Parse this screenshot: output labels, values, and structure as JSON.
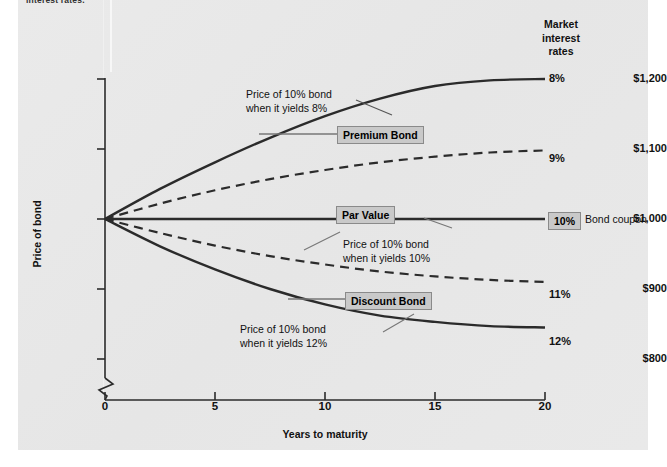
{
  "figure": {
    "top_caption": "interest rates.",
    "background_color": "#e8e8e8",
    "line_color": "#2b2b2b",
    "box_fill": "#c9c9c9"
  },
  "axes": {
    "ylabel": "Price of bond",
    "xlabel": "Years to maturity",
    "yticks": [
      "$1,200",
      "$1,100",
      "$1,000",
      "$900",
      "$800"
    ],
    "xticks": [
      "0",
      "5",
      "10",
      "15",
      "20"
    ],
    "axis_break": true
  },
  "legend": {
    "title_line1": "Market",
    "title_line2": "interest",
    "title_line3": "rates",
    "rates": [
      "8%",
      "9%",
      "10%",
      "11%",
      "12%"
    ],
    "coupon_label": "10%",
    "coupon_text": "Bond coupon"
  },
  "callouts": {
    "premium_box": "Premium Bond",
    "par_box": "Par Value",
    "discount_box": "Discount Bond",
    "premium_text_l1": "Price of 10% bond",
    "premium_text_l2": "when it yields 8%",
    "par_text_l1": "Price of 10% bond",
    "par_text_l2": "when it yields 10%",
    "discount_text_l1": "Price of 10% bond",
    "discount_text_l2": "when it yields 12%"
  },
  "chart_data": {
    "type": "line",
    "title": "",
    "xlabel": "Years to maturity",
    "ylabel": "Price of bond",
    "xlim": [
      0,
      20
    ],
    "ylim": [
      800,
      1200
    ],
    "grid": false,
    "legend_position": "right",
    "x": [
      0,
      2.5,
      5,
      7.5,
      10,
      12.5,
      15,
      17.5,
      20
    ],
    "series": [
      {
        "name": "8%",
        "style": "solid",
        "label": "Price of 10% bond when it yields 8%",
        "values": [
          1000,
          1043,
          1081,
          1116,
          1147,
          1172,
          1190,
          1198,
          1200
        ]
      },
      {
        "name": "9%",
        "style": "dashed",
        "label": "",
        "values": [
          1000,
          1022,
          1041,
          1057,
          1070,
          1081,
          1089,
          1095,
          1098
        ]
      },
      {
        "name": "10%",
        "style": "solid",
        "label": "Price of 10% bond when it yields 10%",
        "values": [
          1000,
          1000,
          1000,
          1000,
          1000,
          1000,
          1000,
          1000,
          1000
        ]
      },
      {
        "name": "11%",
        "style": "dashed",
        "label": "",
        "values": [
          1000,
          980,
          962,
          947,
          935,
          925,
          918,
          913,
          910
        ]
      },
      {
        "name": "12%",
        "style": "solid",
        "label": "Price of 10% bond when it yields 12%",
        "values": [
          1000,
          961,
          928,
          900,
          878,
          862,
          853,
          847,
          845
        ]
      }
    ]
  }
}
